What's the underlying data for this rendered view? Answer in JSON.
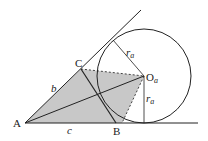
{
  "diagram": {
    "points": {
      "A": {
        "label": "A",
        "x": 25,
        "y": 123
      },
      "B": {
        "label": "B",
        "x": 116,
        "y": 123
      },
      "C": {
        "label": "C",
        "x": 81,
        "y": 69
      },
      "Oa": {
        "label": "O",
        "sub": "a",
        "x": 144,
        "y": 76
      },
      "T_bottom": {
        "x": 144,
        "y": 123
      },
      "T_upper": {
        "x": 113,
        "y": 40
      }
    },
    "circle": {
      "cx": 144,
      "cy": 76,
      "r": 47
    },
    "side_labels": {
      "b": "b",
      "c": "c"
    },
    "radius_label": {
      "r": "r",
      "sub": "a"
    },
    "colors": {
      "stroke": "#222222",
      "shade": "#c8c8c8",
      "background": "#ffffff"
    }
  }
}
